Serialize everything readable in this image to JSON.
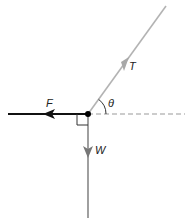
{
  "diagram": {
    "type": "free-body-diagram",
    "labels": {
      "tension": "T",
      "friction": "F",
      "weight": "W",
      "angle": "θ"
    },
    "colors": {
      "tension": "#b3b3b3",
      "friction": "#111111",
      "weight": "#888888",
      "reference_line": "#999999",
      "point": "#000000"
    },
    "forces": [
      {
        "name": "T",
        "direction": "up-right at angle θ above horizontal"
      },
      {
        "name": "F",
        "direction": "left (horizontal)"
      },
      {
        "name": "W",
        "direction": "down (vertical)"
      }
    ],
    "annotations": [
      "right-angle marker between F and W",
      "dashed horizontal reference line",
      "angle arc θ between T and reference"
    ]
  }
}
